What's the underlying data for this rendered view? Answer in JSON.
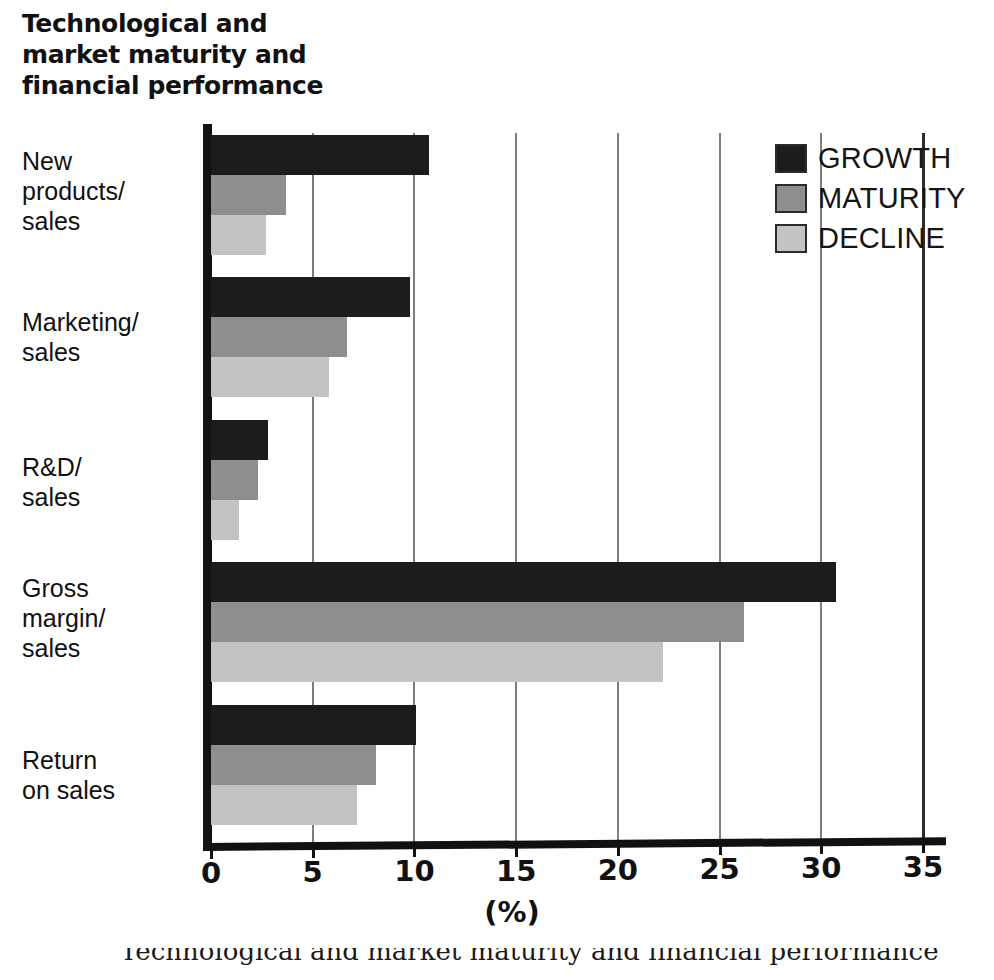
{
  "title": "Technological and\nmarket maturity and\nfinancial performance",
  "axis": {
    "x_title": "(%)",
    "x_ticks": [
      "0",
      "5",
      "10",
      "15",
      "20",
      "25",
      "30",
      "35"
    ]
  },
  "legend": {
    "items": [
      {
        "label": "GROWTH",
        "color": "#1c1c1c"
      },
      {
        "label": "MATURITY",
        "color": "#8e8e8e"
      },
      {
        "label": "DECLINE",
        "color": "#c3c3c3"
      }
    ]
  },
  "caption": "Technological and market maturity and financial performance",
  "chart_data": {
    "type": "bar",
    "orientation": "horizontal",
    "title": "Technological and market maturity and financial performance",
    "xlabel": "(%)",
    "ylabel": "",
    "xlim": [
      0,
      35
    ],
    "xticks": [
      0,
      5,
      10,
      15,
      20,
      25,
      30,
      35
    ],
    "grid": true,
    "legend_position": "top-right",
    "categories": [
      "New\nproducts/\nsales",
      "Marketing/\nsales",
      "R&D/\nsales",
      "Gross\nmargin/\nsales",
      "Return\non sales"
    ],
    "series": [
      {
        "name": "GROWTH",
        "color": "#1c1c1c",
        "values": [
          10.7,
          9.8,
          2.8,
          30.7,
          10.1
        ]
      },
      {
        "name": "MATURITY",
        "color": "#8e8e8e",
        "values": [
          3.7,
          6.7,
          2.3,
          26.2,
          8.1
        ]
      },
      {
        "name": "DECLINE",
        "color": "#c3c3c3",
        "values": [
          2.7,
          5.8,
          1.4,
          22.2,
          7.2
        ]
      }
    ]
  }
}
